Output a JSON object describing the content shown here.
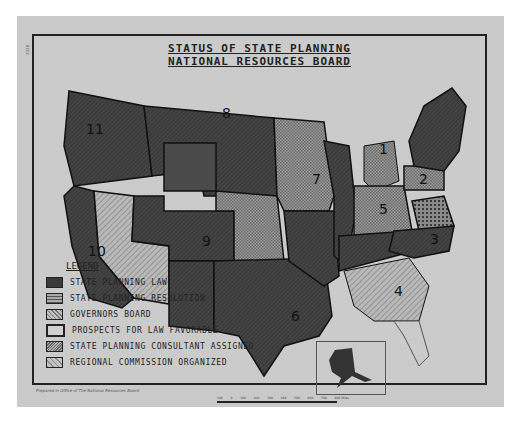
{
  "map": {
    "title_line1": "STATUS OF STATE PLANNING",
    "title_line2": "NATIONAL RESOURCES BOARD",
    "side_code": "3338",
    "footer_credit": "Prepared in Office of The National Resources Board",
    "scale": {
      "labels": [
        "100",
        "0",
        "100",
        "200",
        "300",
        "400",
        "500",
        "600",
        "700",
        "800 Miles"
      ]
    },
    "inset": "Alaska",
    "region_numbers": [
      "1",
      "2",
      "3",
      "4",
      "5",
      "6",
      "7",
      "8",
      "9",
      "10",
      "11"
    ],
    "legend": {
      "title": "LEGEND",
      "items": [
        {
          "label": "STATE PLANNING LAW",
          "pattern": "dark-solid",
          "color": "#3a3a3a"
        },
        {
          "label": "STATE PLANNING RESOLUTION",
          "pattern": "crosshatch",
          "color": "#7a7a7a"
        },
        {
          "label": "GOVERNORS BOARD",
          "pattern": "diagonal-light",
          "color": "#a9a9a9"
        },
        {
          "label": "PROSPECTS FOR LAW FAVORABLE",
          "pattern": "heavy-outline",
          "color": "#cfcfcf"
        },
        {
          "label": "STATE PLANNING CONSULTANT ASSIGNED",
          "pattern": "diagonal-dense",
          "color": "#9a9a9a"
        },
        {
          "label": "REGIONAL COMMISSION ORGANIZED",
          "pattern": "diagonal-wide",
          "color": "#b0b0b0"
        }
      ]
    }
  }
}
